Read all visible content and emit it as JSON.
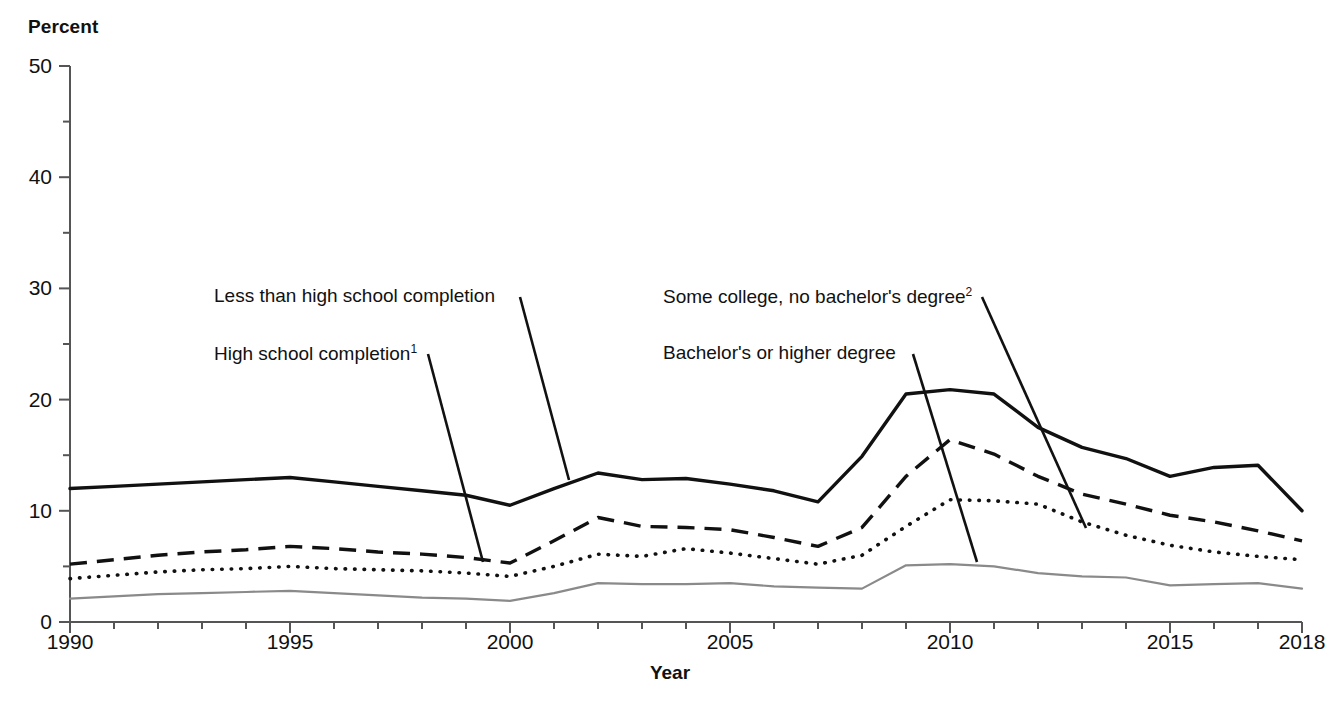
{
  "chart_data": {
    "type": "line",
    "title": "",
    "xlabel": "Year",
    "ylabel": "Percent",
    "ylim": [
      0,
      50
    ],
    "xlim": [
      1990,
      2018
    ],
    "grid": false,
    "legend_position": "inline-annotations",
    "y_ticks": [
      0,
      10,
      20,
      30,
      40,
      50
    ],
    "y_minor_ticks": [
      5,
      15,
      25,
      35,
      45
    ],
    "x_ticks": [
      1990,
      1995,
      2000,
      2005,
      2010,
      2015,
      2018
    ],
    "x": [
      1990,
      1991,
      1992,
      1993,
      1994,
      1995,
      1996,
      1997,
      1998,
      1999,
      2000,
      2001,
      2002,
      2003,
      2004,
      2005,
      2006,
      2007,
      2008,
      2009,
      2010,
      2011,
      2012,
      2013,
      2014,
      2015,
      2016,
      2017,
      2018
    ],
    "series": [
      {
        "name": "Less than high school completion",
        "style": "solid-thick",
        "color": "#111111",
        "values": [
          12.0,
          12.2,
          12.4,
          12.6,
          12.8,
          13.0,
          12.6,
          12.2,
          11.8,
          11.4,
          10.5,
          12.0,
          13.4,
          12.8,
          12.9,
          12.4,
          11.8,
          10.8,
          14.9,
          20.5,
          20.9,
          20.5,
          17.5,
          15.7,
          14.7,
          13.1,
          13.9,
          14.1,
          10.0
        ]
      },
      {
        "name": "High school completion",
        "footnote": "1",
        "style": "dashed",
        "color": "#111111",
        "values": [
          5.2,
          5.6,
          6.0,
          6.3,
          6.5,
          6.8,
          6.6,
          6.3,
          6.1,
          5.8,
          5.3,
          7.3,
          9.4,
          8.6,
          8.5,
          8.3,
          7.6,
          6.8,
          8.5,
          13.1,
          16.4,
          15.1,
          13.1,
          11.5,
          10.6,
          9.6,
          9.0,
          8.2,
          7.3
        ]
      },
      {
        "name": "Some college, no bachelor's degree",
        "footnote": "2",
        "style": "dotted",
        "color": "#111111",
        "values": [
          3.9,
          4.2,
          4.5,
          4.7,
          4.8,
          5.0,
          4.8,
          4.7,
          4.6,
          4.4,
          4.1,
          5.0,
          6.1,
          5.9,
          6.6,
          6.2,
          5.7,
          5.2,
          6.0,
          8.6,
          11.0,
          10.9,
          10.6,
          9.0,
          7.8,
          6.9,
          6.3,
          5.9,
          5.6
        ]
      },
      {
        "name": "Bachelor's or higher degree",
        "style": "solid-thin-gray",
        "color": "#8a8a8a",
        "values": [
          2.1,
          2.3,
          2.5,
          2.6,
          2.7,
          2.8,
          2.6,
          2.4,
          2.2,
          2.1,
          1.9,
          2.6,
          3.5,
          3.4,
          3.4,
          3.5,
          3.2,
          3.1,
          3.0,
          5.1,
          5.2,
          5.0,
          4.4,
          4.1,
          4.0,
          3.3,
          3.4,
          3.5,
          3.0
        ]
      }
    ],
    "annotations": [
      {
        "text": "Less than high school completion",
        "label_x": 214,
        "label_y": 285,
        "leader": {
          "x1": 520,
          "y1": 297,
          "x2": 569,
          "y2": 480
        }
      },
      {
        "text": "High school completion",
        "footnote": "1",
        "label_x": 214,
        "label_y": 342,
        "leader": {
          "x1": 428,
          "y1": 354,
          "x2": 483,
          "y2": 562
        }
      },
      {
        "text": "Some college, no bachelor's degree",
        "footnote": "2",
        "label_x": 663,
        "label_y": 285,
        "leader": {
          "x1": 982,
          "y1": 297,
          "x2": 1086,
          "y2": 528
        }
      },
      {
        "text": "Bachelor's or higher degree",
        "label_x": 663,
        "label_y": 342,
        "leader": {
          "x1": 913,
          "y1": 354,
          "x2": 977,
          "y2": 562
        }
      }
    ]
  },
  "axes": {
    "y_title": "Percent",
    "x_title": "Year",
    "y_tick_labels": [
      "0",
      "10",
      "20",
      "30",
      "40",
      "50"
    ],
    "x_tick_labels": [
      "1990",
      "1995",
      "2000",
      "2005",
      "2010",
      "2015",
      "2018"
    ]
  },
  "colors": {
    "axis": "#555555",
    "primary_line": "#111111",
    "secondary_line": "#8a8a8a",
    "text": "#111111",
    "background": "#ffffff"
  }
}
